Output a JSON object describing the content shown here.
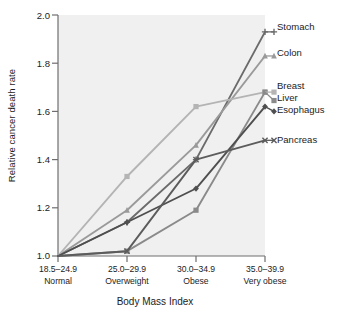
{
  "chart_data": {
    "type": "line",
    "title": "",
    "xlabel": "Body Mass Index",
    "ylabel": "Relative cancer death rate",
    "categories": [
      "18.5–24.9",
      "25.0–29.9",
      "30.0–34.9",
      "35.0–39.9"
    ],
    "category_descriptions": [
      "Normal",
      "Overweight",
      "Obese",
      "Very obese"
    ],
    "ylim": [
      1.0,
      2.0
    ],
    "yticks": [
      "1.0",
      "1.2",
      "1.4",
      "1.6",
      "1.8",
      "2.0"
    ],
    "ytick_values": [
      1.0,
      1.2,
      1.4,
      1.6,
      1.8,
      2.0
    ],
    "grid": false,
    "legend_position": "right-inline",
    "plot_background": "#f0f0f0",
    "series": [
      {
        "name": "Stomach",
        "values": [
          1.0,
          1.14,
          1.4,
          1.93
        ],
        "color": "#6b6b6b",
        "marker": "plus"
      },
      {
        "name": "Colon",
        "values": [
          1.0,
          1.19,
          1.46,
          1.83
        ],
        "color": "#9a9a9a",
        "marker": "triangle"
      },
      {
        "name": "Breast",
        "values": [
          1.0,
          1.33,
          1.62,
          1.68
        ],
        "color": "#b4b4b4",
        "marker": "square"
      },
      {
        "name": "Liver",
        "values": [
          1.0,
          1.02,
          1.19,
          1.68
        ],
        "color": "#8a8a8a",
        "marker": "square"
      },
      {
        "name": "Esophagus",
        "values": [
          1.0,
          1.14,
          1.28,
          1.62
        ],
        "color": "#4f4f4f",
        "marker": "diamond"
      },
      {
        "name": "Pancreas",
        "values": [
          1.0,
          1.02,
          1.4,
          1.48
        ],
        "color": "#5c5c5c",
        "marker": "x"
      }
    ],
    "series_label_groups": [
      {
        "label": "Stomach",
        "y_value": 1.93
      },
      {
        "label": "Colon",
        "y_value": 1.83
      },
      {
        "label": "Breast",
        "y_value": 1.68
      },
      {
        "label": "Liver",
        "y_value": 1.645
      },
      {
        "label": "Esophagus",
        "y_value": 1.6
      },
      {
        "label": "Pancreas",
        "y_value": 1.48
      }
    ]
  },
  "axis": {
    "y_title": "Relative cancer death rate",
    "x_title": "Body Mass Index",
    "ytick_0": "1.0",
    "ytick_1": "1.2",
    "ytick_2": "1.4",
    "ytick_3": "1.6",
    "ytick_4": "1.8",
    "ytick_5": "2.0",
    "xtick_0_range": "18.5–24.9",
    "xtick_0_desc": "Normal",
    "xtick_1_range": "25.0–29.9",
    "xtick_1_desc": "Overweight",
    "xtick_2_range": "30.0–34.9",
    "xtick_2_desc": "Obese",
    "xtick_3_range": "35.0–39.9",
    "xtick_3_desc": "Very obese"
  },
  "labels": {
    "stomach": "Stomach",
    "colon": "Colon",
    "breast": "Breast",
    "liver": "Liver",
    "esophagus": "Esophagus",
    "pancreas": "Pancreas"
  }
}
